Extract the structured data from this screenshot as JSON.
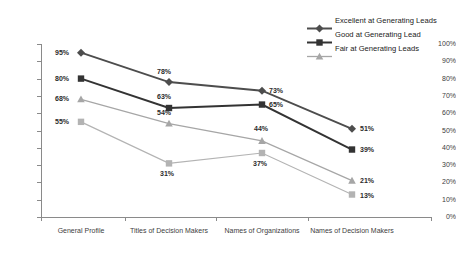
{
  "chart_data": {
    "type": "line",
    "title": "",
    "xlabel": "",
    "ylabel": "",
    "ylim": [
      0,
      100
    ],
    "grid": false,
    "legend_position": "top-right",
    "categories": [
      "General Profile",
      "Titles of Decision Makers",
      "Names of Organizations",
      "Names of Decision Makers"
    ],
    "y_ticks": [
      "0%",
      "10%",
      "20%",
      "30%",
      "40%",
      "50%",
      "60%",
      "70%",
      "80%",
      "90%",
      "100%"
    ],
    "series": [
      {
        "name": "Excellent at Generating Leads",
        "marker": "diamond",
        "color": "#4d4d4d",
        "in_legend": true,
        "values": [
          95,
          78,
          73,
          51
        ],
        "labels": [
          "95%",
          "78%",
          "73%",
          "51%"
        ]
      },
      {
        "name": "Good at Generating Lead",
        "marker": "square",
        "color": "#333333",
        "in_legend": true,
        "values": [
          80,
          63,
          65,
          39
        ],
        "labels": [
          "80%",
          "63%",
          "65%",
          "39%"
        ]
      },
      {
        "name": "Fair at Generating Leads",
        "marker": "triangle",
        "color": "#a6a6a6",
        "in_legend": true,
        "values": [
          68,
          54,
          44,
          21
        ],
        "labels": [
          "68%",
          "54%",
          "44%",
          "21%"
        ]
      },
      {
        "name": "Series 4",
        "marker": "square",
        "color": "#b3b3b3",
        "in_legend": false,
        "values": [
          55,
          31,
          37,
          13
        ],
        "labels": [
          "55%",
          "31%",
          "37%",
          "13%"
        ]
      }
    ]
  },
  "legend": {
    "items": [
      {
        "label": "Excellent at Generating Leads"
      },
      {
        "label": "Good at Generating Lead"
      },
      {
        "label": "Fair at Generating Leads"
      }
    ]
  }
}
